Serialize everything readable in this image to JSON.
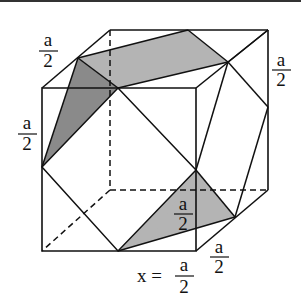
{
  "figure": {
    "type": "truncated cube (cuboctahedron cut) diagram",
    "shade_light": "#b4b4b4",
    "shade_dark": "#8a8a8a",
    "line_color": "#111111",
    "labels": {
      "top_left_edge": {
        "num": "a",
        "den": "2"
      },
      "left_edge": {
        "num": "a",
        "den": "2"
      },
      "right_edge": {
        "num": "a",
        "den": "2"
      },
      "inner_bottom": {
        "num": "a",
        "den": "2"
      },
      "bottom_right_edge": {
        "num": "a",
        "den": "2"
      },
      "x_equation": {
        "prefix": "x =",
        "num": "a",
        "den": "2"
      }
    }
  }
}
